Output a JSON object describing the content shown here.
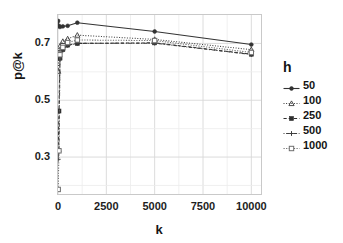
{
  "chart_data": {
    "type": "line",
    "title": "",
    "xlabel": "k",
    "ylabel": "p@k",
    "xlim": [
      0,
      10500
    ],
    "ylim": [
      0.17,
      0.8
    ],
    "xticks": [
      0,
      2500,
      5000,
      7500,
      10000
    ],
    "xtick_labels": [
      "0",
      "2500",
      "5000",
      "7500",
      "10000"
    ],
    "yticks": [
      0.3,
      0.5,
      0.7
    ],
    "ytick_labels": [
      "0.3",
      "0.5",
      "0.7"
    ],
    "grid": true,
    "legend_position": "right",
    "legend_title": "h",
    "x": [
      10,
      50,
      100,
      250,
      500,
      1000,
      5000,
      10000
    ],
    "series": [
      {
        "name": "50",
        "label": "50",
        "linestyle": "solid",
        "marker": "circle",
        "color": "#333333",
        "values": [
          0.779,
          0.762,
          0.758,
          0.76,
          0.762,
          0.773,
          0.742,
          0.696
        ]
      },
      {
        "name": "100",
        "label": "100",
        "linestyle": "dotted",
        "marker": "triangle",
        "color": "#3a3a3a",
        "values": [
          0.602,
          0.668,
          0.69,
          0.707,
          0.716,
          0.729,
          0.714,
          0.678
        ]
      },
      {
        "name": "250",
        "label": "250",
        "linestyle": "dashed",
        "marker": "square-filled",
        "color": "#2e2e2e",
        "values": [
          0.323,
          0.462,
          0.648,
          0.678,
          0.694,
          0.7,
          0.702,
          0.662
        ]
      },
      {
        "name": "500",
        "label": "500",
        "linestyle": "dotdash",
        "marker": "plus",
        "color": "#3d3d3d",
        "values": [
          0.292,
          0.32,
          0.645,
          0.676,
          0.693,
          0.7,
          0.701,
          0.661
        ]
      },
      {
        "name": "1000",
        "label": "1000",
        "linestyle": "longdash-dot",
        "marker": "square-open",
        "color": "#6e6e6e",
        "values": [
          0.186,
          0.322,
          0.66,
          0.686,
          0.703,
          0.712,
          0.71,
          0.668
        ]
      }
    ]
  }
}
